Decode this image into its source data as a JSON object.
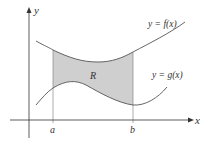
{
  "diagram": {
    "axes": {
      "x_label": "x",
      "y_label": "y"
    },
    "curves": [
      {
        "name": "f",
        "label": "y = f(x)"
      },
      {
        "name": "g",
        "label": "y = g(x)"
      }
    ],
    "region_label": "R",
    "bounds": {
      "a": "a",
      "b": "b"
    },
    "colors": {
      "region_fill": "#cfcfcf",
      "curve": "#555555",
      "axis": "#333333"
    }
  }
}
